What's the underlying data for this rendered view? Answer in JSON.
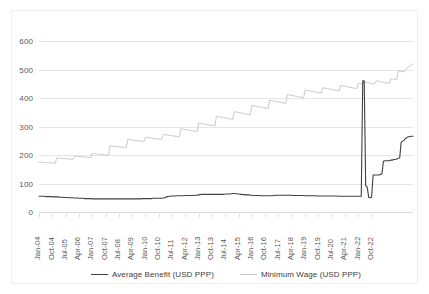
{
  "chart_data": {
    "type": "line",
    "title": "",
    "xlabel": "",
    "ylabel": "",
    "ylim": [
      0,
      600
    ],
    "ytick_values": [
      0,
      100,
      200,
      300,
      400,
      500,
      600
    ],
    "ytick_labels": [
      "0",
      "100",
      "200",
      "300",
      "400",
      "500",
      "600"
    ],
    "grid": true,
    "legend_position": "bottom",
    "x_axis_note": "Monthly observations Jan-2004 through Dec-2022; every 9th month is labeled",
    "xtick_labels": [
      "Jan-04",
      "Oct-04",
      "Jul-05",
      "Apr-06",
      "Jan-07",
      "Oct-07",
      "Jul-08",
      "Apr-09",
      "Jan-10",
      "Oct-10",
      "Jul-11",
      "Apr-12",
      "Jan-13",
      "Oct-13",
      "Jul-14",
      "Apr-15",
      "Jan-16",
      "Oct-16",
      "Jul-17",
      "Apr-18",
      "Jan-19",
      "Oct-19",
      "Jul-20",
      "Apr-21",
      "Jan-22",
      "Oct-22"
    ],
    "series": [
      {
        "name": "Average Benefit (USD PPP)",
        "color": "#404040",
        "values": [
          55,
          55,
          55,
          55,
          55,
          54,
          54,
          54,
          54,
          54,
          53,
          53,
          53,
          53,
          52,
          52,
          52,
          51,
          51,
          51,
          50,
          50,
          50,
          50,
          49,
          49,
          49,
          48,
          48,
          48,
          48,
          47,
          47,
          47,
          47,
          47,
          46,
          46,
          46,
          46,
          46,
          46,
          46,
          46,
          46,
          46,
          46,
          46,
          46,
          46,
          46,
          46,
          46,
          46,
          46,
          46,
          46,
          46,
          46,
          46,
          46,
          46,
          46,
          46,
          46,
          46,
          46,
          46,
          46,
          46,
          47,
          47,
          47,
          47,
          47,
          47,
          47,
          48,
          48,
          48,
          48,
          48,
          48,
          48,
          49,
          49,
          53,
          54,
          55,
          55,
          56,
          56,
          56,
          57,
          57,
          57,
          57,
          57,
          57,
          58,
          58,
          58,
          58,
          58,
          58,
          59,
          59,
          59,
          60,
          61,
          62,
          62,
          62,
          62,
          62,
          62,
          62,
          62,
          62,
          62,
          62,
          62,
          62,
          62,
          62,
          62,
          63,
          63,
          63,
          63,
          64,
          65,
          65,
          64,
          64,
          63,
          62,
          62,
          61,
          61,
          60,
          60,
          60,
          59,
          59,
          58,
          58,
          58,
          58,
          58,
          57,
          57,
          57,
          57,
          57,
          57,
          57,
          57,
          57,
          58,
          59,
          59,
          59,
          59,
          59,
          59,
          59,
          59,
          59,
          59,
          59,
          59,
          58,
          58,
          58,
          58,
          58,
          58,
          58,
          58,
          57,
          57,
          57,
          57,
          57,
          57,
          57,
          57,
          56,
          56,
          56,
          56,
          56,
          56,
          56,
          56,
          56,
          56,
          56,
          56,
          56,
          56,
          55,
          55,
          55,
          55,
          55,
          55,
          55,
          55,
          55,
          55,
          55,
          55,
          55,
          55,
          55,
          55,
          55,
          460,
          460,
          92,
          88,
          52,
          50,
          52,
          130,
          130,
          130,
          130,
          130,
          132,
          134,
          178,
          180,
          180,
          180,
          180,
          182,
          182,
          184,
          184,
          186,
          188,
          190,
          245,
          248,
          252,
          258,
          262,
          264,
          265,
          266,
          266
        ]
      },
      {
        "name": "Minimum Wage (USD PPP)",
        "color": "#c9c9c9",
        "values": [
          175,
          175,
          174,
          174,
          174,
          173,
          173,
          173,
          172,
          172,
          172,
          171,
          190,
          190,
          189,
          189,
          188,
          188,
          187,
          187,
          186,
          186,
          185,
          185,
          196,
          196,
          195,
          195,
          194,
          194,
          193,
          193,
          192,
          192,
          191,
          191,
          205,
          205,
          204,
          204,
          203,
          203,
          202,
          202,
          201,
          201,
          200,
          200,
          232,
          232,
          231,
          230,
          230,
          229,
          229,
          228,
          228,
          227,
          227,
          226,
          254,
          254,
          253,
          252,
          252,
          251,
          250,
          250,
          249,
          249,
          248,
          247,
          262,
          262,
          261,
          260,
          259,
          258,
          258,
          257,
          256,
          256,
          255,
          254,
          272,
          272,
          271,
          270,
          269,
          268,
          268,
          267,
          266,
          265,
          264,
          264,
          292,
          291,
          290,
          289,
          288,
          288,
          287,
          286,
          285,
          284,
          283,
          283,
          312,
          311,
          310,
          309,
          308,
          307,
          306,
          305,
          304,
          304,
          303,
          302,
          336,
          335,
          334,
          333,
          332,
          331,
          330,
          329,
          328,
          327,
          326,
          325,
          352,
          351,
          350,
          349,
          348,
          347,
          346,
          345,
          344,
          343,
          342,
          341,
          374,
          373,
          372,
          371,
          370,
          369,
          368,
          367,
          366,
          365,
          364,
          363,
          392,
          391,
          390,
          389,
          388,
          387,
          386,
          385,
          384,
          383,
          382,
          381,
          412,
          411,
          410,
          409,
          408,
          407,
          406,
          405,
          404,
          403,
          402,
          401,
          428,
          427,
          426,
          425,
          424,
          423,
          422,
          421,
          420,
          419,
          418,
          417,
          436,
          435,
          434,
          433,
          432,
          431,
          430,
          429,
          428,
          427,
          426,
          425,
          444,
          443,
          442,
          441,
          440,
          439,
          438,
          437,
          436,
          435,
          434,
          433,
          452,
          451,
          450,
          449,
          455,
          455,
          454,
          453,
          452,
          451,
          450,
          449,
          460,
          459,
          458,
          457,
          456,
          455,
          454,
          453,
          452,
          452,
          468,
          467,
          466,
          465,
          464,
          496,
          495,
          494,
          493,
          492,
          500,
          505,
          508,
          512,
          516,
          520
        ]
      }
    ]
  },
  "legend": {
    "items": [
      {
        "label": "Average Benefit (USD PPP)",
        "color": "#404040"
      },
      {
        "label": "Minimum Wage (USD PPP)",
        "color": "#c9c9c9"
      }
    ]
  }
}
